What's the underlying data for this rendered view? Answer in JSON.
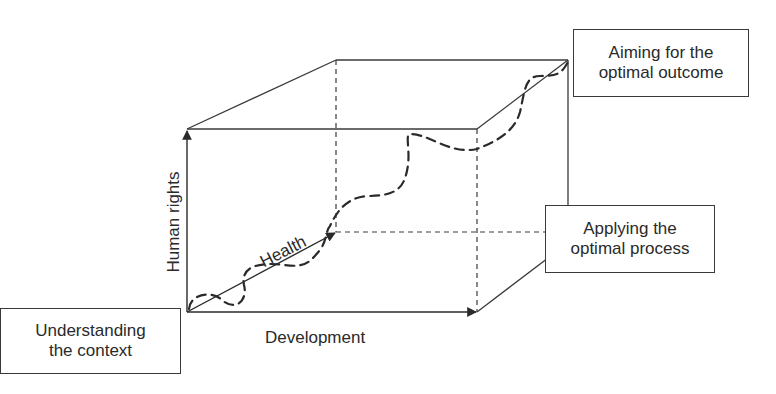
{
  "diagram": {
    "type": "3d-cube-framework",
    "axes": {
      "vertical": "Human rights",
      "horizontal": "Development",
      "depth": "Health"
    },
    "boxes": {
      "start": [
        "Understanding",
        "the context"
      ],
      "process": [
        "Applying the",
        "optimal process"
      ],
      "outcome": [
        "Aiming for the",
        "optimal outcome"
      ]
    },
    "colors": {
      "line": "#3a3a3a",
      "dashed_path": "#2a2a2a",
      "background": "#ffffff"
    }
  }
}
